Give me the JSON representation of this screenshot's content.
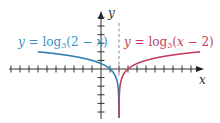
{
  "chart_data": {
    "type": "line",
    "title": "",
    "xlabel": "x",
    "ylabel": "y",
    "xlim": [
      -10,
      11
    ],
    "ylim": [
      -6,
      6.5
    ],
    "grid": false,
    "x_ticks": [
      -10,
      -9,
      -8,
      -7,
      -6,
      -5,
      -4,
      -3,
      -2,
      -1,
      1,
      2,
      3,
      4,
      5,
      6,
      7,
      8,
      9,
      10
    ],
    "y_ticks": [
      -5,
      -4,
      -3,
      -2,
      -1,
      1,
      2,
      3,
      4,
      5,
      6
    ],
    "asymptote": {
      "type": "vertical",
      "x": 2,
      "style": "dashed"
    },
    "series": [
      {
        "name": "y = log3(2 − x)",
        "color": "#2f7fb8",
        "domain": "x < 2",
        "x": [
          -7,
          -4,
          -1,
          0,
          1,
          1.5,
          1.9,
          1.99
        ],
        "values": [
          2,
          1.63,
          1,
          0.63,
          0,
          -0.63,
          -2.1,
          -4.19
        ]
      },
      {
        "name": "y = log3(x − 2)",
        "color": "#c0405e",
        "domain": "x > 2",
        "x": [
          2.01,
          2.1,
          2.5,
          3,
          4,
          5,
          8,
          11
        ],
        "values": [
          -4.19,
          -2.1,
          -0.63,
          0,
          0.63,
          1,
          1.63,
          2
        ]
      }
    ],
    "annotations": [
      {
        "text": "y = log3(2 − x)",
        "color": "#3a8fc4",
        "position": "upper-left"
      },
      {
        "text": "y = log3(x − 2)",
        "color": "#c0405e",
        "position": "upper-right"
      }
    ]
  },
  "labels": {
    "blue": {
      "y": "y",
      "eq": " = log",
      "base": "3",
      "arg_open": "(2 − ",
      "var": "x",
      "arg_close": ")"
    },
    "red": {
      "y": "y",
      "eq": " = log",
      "base": "3",
      "arg_open": "(",
      "var": "x",
      "arg_close": " − 2)"
    },
    "x_axis": "x",
    "y_axis": "y"
  },
  "colors": {
    "axis": "#333333",
    "blue": "#2f7fb8",
    "red": "#c0405e",
    "asymptote": "#888888"
  }
}
